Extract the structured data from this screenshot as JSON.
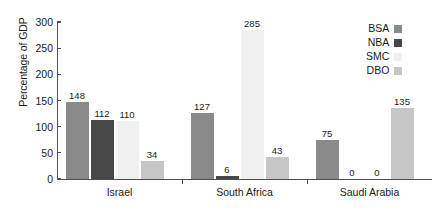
{
  "chart_data": {
    "type": "bar",
    "title": "",
    "xlabel": "",
    "ylabel": "Percentage of GDP",
    "ylim": [
      0,
      300
    ],
    "yticks": [
      0,
      50,
      100,
      150,
      200,
      250,
      300
    ],
    "ytick_labels": [
      "0",
      "50",
      "100",
      "150",
      "200",
      "250",
      "300"
    ],
    "grid": false,
    "legend_position": "top-right",
    "categories": [
      "Israel",
      "South Africa",
      "Saudi Arabia"
    ],
    "series": [
      {
        "name": "BSA",
        "color": "#8a8a8a",
        "values": [
          148,
          127,
          75
        ],
        "labels": [
          "148",
          "127",
          "75"
        ]
      },
      {
        "name": "NBA",
        "color": "#474747",
        "values": [
          112,
          6,
          0
        ],
        "labels": [
          "112",
          "6",
          "0"
        ]
      },
      {
        "name": "SMC",
        "color": "#f0f0f0",
        "values": [
          110,
          285,
          0
        ],
        "labels": [
          "110",
          "285",
          "0"
        ]
      },
      {
        "name": "DBO",
        "color": "#c6c6c6",
        "values": [
          34,
          43,
          135
        ],
        "labels": [
          "34",
          "43",
          "135"
        ]
      }
    ]
  },
  "axis": {
    "y_title": "Percentage of GDP"
  }
}
